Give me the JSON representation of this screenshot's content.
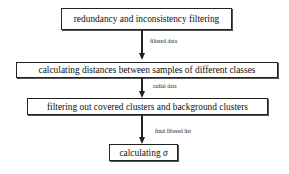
{
  "diagram": {
    "type": "flowchart",
    "direction": "top-to-bottom",
    "nodes": [
      {
        "id": "n1",
        "label": "redundancy and inconsistency filtering"
      },
      {
        "id": "n2",
        "label": "calculating distances between samples of different classes"
      },
      {
        "id": "n3",
        "label": "filtering out covered clusters and background clusters"
      },
      {
        "id": "n4",
        "label_prefix": "calculating ",
        "label_symbol": "σ"
      }
    ],
    "edges": [
      {
        "from": "n1",
        "to": "n2",
        "label": "filtered data"
      },
      {
        "from": "n2",
        "to": "n3",
        "label": "radial data"
      },
      {
        "from": "n3",
        "to": "n4",
        "label": "final filtered list"
      }
    ]
  }
}
